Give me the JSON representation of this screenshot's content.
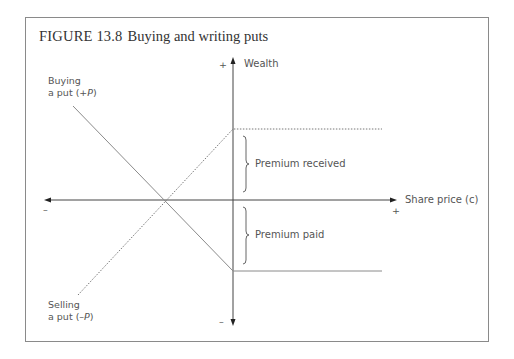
{
  "figure": {
    "number": "FIGURE 13.8",
    "title": "Buying and writing puts"
  },
  "axes": {
    "y_label": "Wealth",
    "y_plus": "+",
    "y_minus": "–",
    "x_label": "Share price (c)",
    "x_plus": "+",
    "x_minus": "–"
  },
  "lines": {
    "buying_line1": "Buying",
    "buying_line2_prefix": "a put (+",
    "buying_var": "P",
    "buying_suffix": ")",
    "selling_line1": "Selling",
    "selling_line2_prefix": "a put (–",
    "selling_var": "P",
    "selling_suffix": ")"
  },
  "annotations": {
    "premium_received": "Premium received",
    "premium_paid": "Premium paid"
  },
  "colors": {
    "axis": "#444444",
    "line": "#8a8a8a",
    "frame": "#8a8a8a"
  }
}
